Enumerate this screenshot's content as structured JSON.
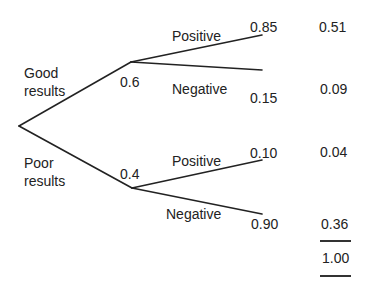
{
  "root": {
    "branches": [
      {
        "label_line1": "Good",
        "label_line2": "results",
        "probability": "0.6",
        "outcomes": [
          {
            "label": "Positive",
            "conditional": "0.85",
            "joint": "0.51"
          },
          {
            "label": "Negative",
            "conditional": "0.15",
            "joint": "0.09"
          }
        ]
      },
      {
        "label_line1": "Poor",
        "label_line2": "results",
        "probability": "0.4",
        "outcomes": [
          {
            "label": "Positive",
            "conditional": "0.10",
            "joint": "0.04"
          },
          {
            "label": "Negative",
            "conditional": "0.90",
            "joint": "0.36"
          }
        ]
      }
    ]
  },
  "total": "1.00",
  "colors": {
    "line": "#222222",
    "text": "#222222",
    "background": "#ffffff"
  }
}
